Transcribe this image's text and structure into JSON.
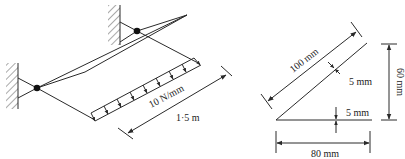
{
  "figure": {
    "type": "engineering-diagram",
    "left_panel": {
      "description": "Cantilever bracket frame fixed to two walls with uniformly distributed load",
      "load_label": "10 N/mm",
      "length_label": "1·5 m"
    },
    "right_panel": {
      "description": "Cross-section of angle/inclined plate",
      "dim_diagonal": "100 mm",
      "dim_thickness_diagonal": "5 mm",
      "dim_thickness_horizontal": "5 mm",
      "dim_height": "60 mm",
      "dim_width": "80 mm"
    },
    "colors": {
      "line": "#2a2a2a",
      "background": "#ffffff"
    }
  }
}
